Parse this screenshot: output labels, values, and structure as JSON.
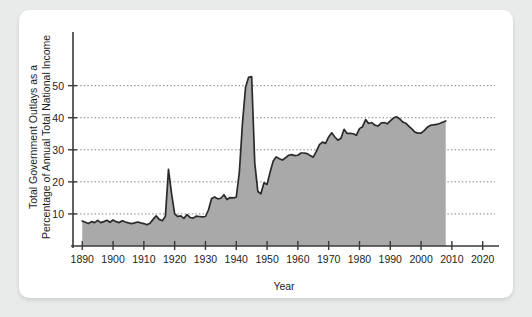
{
  "figure": {
    "background_color": "#e9eaea",
    "card_color": "#ffffff"
  },
  "chart_data": {
    "type": "area",
    "title": "",
    "subtitle": "",
    "xlabel": "Year",
    "ylabel": "Total Government Outlays as a Percentage of Annual Total National Income",
    "ylabel_line1": "Total Government Outlays as a",
    "ylabel_line2": "Percentage of Annual Total National Income",
    "xlim": [
      1887,
      2024
    ],
    "ylim": [
      0,
      58
    ],
    "xticks": [
      1890,
      1900,
      1910,
      1920,
      1930,
      1940,
      1950,
      1960,
      1970,
      1980,
      1990,
      2000,
      2010,
      2020
    ],
    "xticklabels": [
      "1890",
      "1900",
      "1910",
      "1920",
      "1930",
      "1940",
      "1950",
      "1960",
      "1970",
      "1980",
      "1990",
      "2000",
      "2010",
      "2020"
    ],
    "yticks": [
      10,
      20,
      30,
      40,
      50
    ],
    "yticklabels": [
      "10",
      "20",
      "30",
      "40",
      "50"
    ],
    "grid": "horizontal-dotted",
    "legend": "none",
    "fill_color": "#a9a9a9",
    "line_color": "#2b2b2b",
    "series": [
      {
        "name": "Total Government Outlays as a Percentage of Annual Total National Income",
        "x": [
          1890,
          1891,
          1892,
          1893,
          1894,
          1895,
          1896,
          1897,
          1898,
          1899,
          1900,
          1901,
          1902,
          1903,
          1904,
          1905,
          1906,
          1907,
          1908,
          1909,
          1910,
          1911,
          1912,
          1913,
          1914,
          1915,
          1916,
          1917,
          1918,
          1919,
          1920,
          1921,
          1922,
          1923,
          1924,
          1925,
          1926,
          1927,
          1928,
          1929,
          1930,
          1931,
          1932,
          1933,
          1934,
          1935,
          1936,
          1937,
          1938,
          1939,
          1940,
          1941,
          1942,
          1943,
          1944,
          1945,
          1946,
          1947,
          1948,
          1949,
          1950,
          1951,
          1952,
          1953,
          1954,
          1955,
          1956,
          1957,
          1958,
          1959,
          1960,
          1961,
          1962,
          1963,
          1964,
          1965,
          1966,
          1967,
          1968,
          1969,
          1970,
          1971,
          1972,
          1973,
          1974,
          1975,
          1976,
          1977,
          1978,
          1979,
          1980,
          1981,
          1982,
          1983,
          1984,
          1985,
          1986,
          1987,
          1988,
          1989,
          1990,
          1991,
          1992,
          1993,
          1994,
          1995,
          1996,
          1997,
          1998,
          1999,
          2000,
          2001,
          2002,
          2003,
          2004,
          2005,
          2006,
          2007,
          2008
        ],
        "values": [
          7.8,
          7.4,
          7.0,
          7.6,
          7.3,
          8.0,
          7.3,
          7.6,
          8.0,
          7.4,
          8.1,
          7.6,
          7.3,
          7.9,
          7.5,
          7.2,
          7.0,
          7.2,
          7.5,
          7.2,
          7.0,
          6.6,
          7.1,
          8.3,
          9.4,
          8.3,
          7.9,
          9.3,
          23.9,
          16.3,
          10.0,
          9.2,
          9.4,
          8.6,
          9.8,
          8.9,
          8.7,
          9.3,
          9.2,
          9.1,
          9.2,
          11.3,
          14.8,
          15.3,
          14.7,
          14.9,
          16.0,
          14.5,
          15.1,
          15.0,
          15.2,
          23.0,
          38.0,
          49.4,
          52.6,
          52.8,
          26.0,
          17.0,
          16.3,
          19.7,
          19.2,
          23.1,
          26.5,
          27.8,
          27.2,
          26.8,
          27.5,
          28.3,
          28.5,
          28.2,
          28.3,
          29.0,
          29.0,
          28.8,
          28.2,
          27.7,
          29.5,
          31.6,
          32.4,
          32.0,
          34.0,
          35.3,
          34.0,
          33.0,
          33.6,
          36.4,
          35.1,
          35.1,
          35.0,
          34.5,
          36.6,
          37.2,
          39.4,
          38.2,
          38.5,
          37.7,
          37.4,
          38.3,
          38.5,
          38.1,
          39.0,
          39.9,
          40.3,
          39.7,
          38.7,
          38.3,
          37.4,
          36.5,
          35.5,
          35.2,
          35.2,
          36.0,
          37.0,
          37.6,
          37.8,
          37.9,
          38.2,
          38.6,
          39.0
        ]
      }
    ]
  }
}
